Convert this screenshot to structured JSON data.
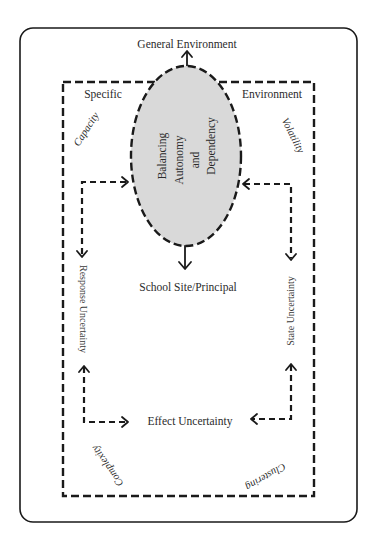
{
  "diagram": {
    "title_top": "General Environment",
    "specific_environment": {
      "left_label": "Specific",
      "right_label": "Environment"
    },
    "center_node": {
      "lines": [
        "Balancing",
        "Autonomy",
        "and",
        "Dependency"
      ],
      "fill": "#d9d9d9"
    },
    "school_site": "School Site/Principal",
    "uncertainties": {
      "response": "Response Uncertainty",
      "state": "State Uncertainty",
      "effect": "Effect Uncertainty"
    },
    "environment_dimensions": {
      "top_left": "Capacity",
      "top_right": "Volatility",
      "bottom_left": "Complexity",
      "bottom_right": "Clustering"
    },
    "colors": {
      "stroke": "#1a1a1a",
      "ellipse_fill": "#d9d9d9",
      "background": "#ffffff"
    }
  }
}
